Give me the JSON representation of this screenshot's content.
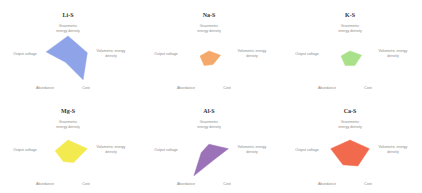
{
  "chart_data": {
    "type": "radar",
    "axes": [
      "Gravimetric energy density",
      "Volumetric energy density",
      "Cost",
      "Abundance",
      "Output voltage"
    ],
    "axis_labels_display": [
      [
        "Gravimetric",
        "energy density"
      ],
      [
        "Volumetric energy",
        "density"
      ],
      [
        "Cost"
      ],
      [
        "Abundance"
      ],
      [
        "Output voltage"
      ]
    ],
    "range": [
      0,
      1
    ],
    "grid": false,
    "legend": "none",
    "charts": [
      {
        "title": "Li-S",
        "color": "#8fa3e8",
        "values": [
          0.85,
          0.75,
          0.95,
          0.15,
          0.85
        ]
      },
      {
        "title": "Na-S",
        "color": "#f4a96a",
        "values": [
          0.3,
          0.45,
          0.25,
          0.3,
          0.35
        ]
      },
      {
        "title": "K-S",
        "color": "#a9e08a",
        "values": [
          0.3,
          0.45,
          0.3,
          0.3,
          0.35
        ]
      },
      {
        "title": "Mg-S",
        "color": "#f2ea4e",
        "values": [
          0.55,
          0.75,
          0.35,
          0.3,
          0.5
        ]
      },
      {
        "title": "Al-S",
        "color": "#9b72b8",
        "values": [
          0.4,
          0.75,
          0.25,
          0.95,
          0.3
        ]
      },
      {
        "title": "Ca-S",
        "color": "#f26a4e",
        "values": [
          0.55,
          0.75,
          0.5,
          0.45,
          0.75
        ]
      }
    ]
  }
}
